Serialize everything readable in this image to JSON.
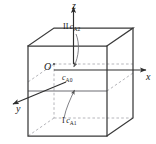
{
  "figure": {
    "type": "technical-diagram",
    "background_color": "#ffffff",
    "line_color": "#3a3a3a",
    "dashed_color": "#9a9aa0",
    "text_color": "#1a1a1a",
    "axes": {
      "z": {
        "label": "z",
        "direction": "up"
      },
      "x": {
        "label": "x",
        "direction": "right"
      },
      "y": {
        "label": "y",
        "direction": "down-left"
      },
      "origin": {
        "label": "O"
      }
    },
    "labels": {
      "top_region": {
        "roman": "II",
        "symbol": "c",
        "subscript": "A2"
      },
      "center": {
        "roman": "",
        "symbol": "c",
        "subscript": "A0"
      },
      "bottom_region": {
        "roman": "I",
        "symbol": "c",
        "subscript": "A1"
      }
    },
    "annotations": [
      {
        "name": "arrow-from-ca2-to-center",
        "style": "curved",
        "direction": "down"
      },
      {
        "name": "arrow-from-ca1-to-midplane",
        "style": "curved",
        "direction": "up"
      }
    ]
  }
}
